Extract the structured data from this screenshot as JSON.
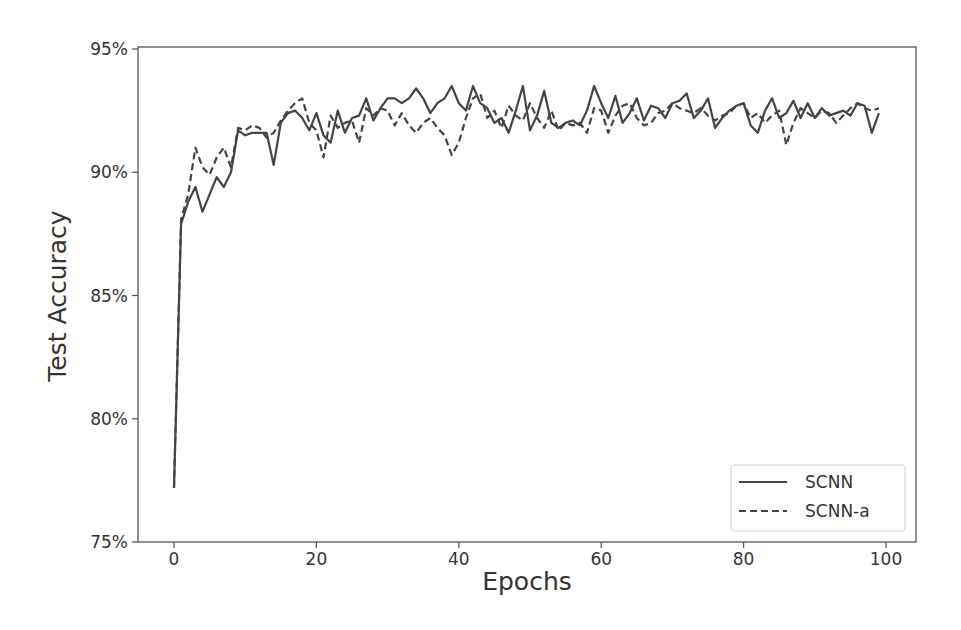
{
  "chart_data": {
    "type": "line",
    "title": "",
    "xlabel": "Epochs",
    "ylabel": "Test Accuracy",
    "xlim": [
      -5,
      104
    ],
    "ylim": [
      75,
      95
    ],
    "xticks": [
      0,
      20,
      40,
      60,
      80,
      100
    ],
    "yticks": [
      75,
      80,
      85,
      90,
      95
    ],
    "ytick_labels": [
      "75%",
      "80%",
      "85%",
      "90%",
      "95%"
    ],
    "grid": false,
    "legend_position": "lower right",
    "line_color": "#444444",
    "series": [
      {
        "name": "SCNN",
        "style": "solid",
        "x": [
          0,
          1,
          2,
          3,
          4,
          5,
          6,
          7,
          8,
          9,
          10,
          11,
          12,
          13,
          14,
          15,
          16,
          17,
          18,
          19,
          20,
          21,
          22,
          23,
          24,
          25,
          26,
          27,
          28,
          29,
          30,
          31,
          32,
          33,
          34,
          35,
          36,
          37,
          38,
          39,
          40,
          41,
          42,
          43,
          44,
          45,
          46,
          47,
          48,
          49,
          50,
          51,
          52,
          53,
          54,
          55,
          56,
          57,
          58,
          59,
          60,
          61,
          62,
          63,
          64,
          65,
          66,
          67,
          68,
          69,
          70,
          71,
          72,
          73,
          74,
          75,
          76,
          77,
          78,
          79,
          80,
          81,
          82,
          83,
          84,
          85,
          86,
          87,
          88,
          89,
          90,
          91,
          92,
          93,
          94,
          95,
          96,
          97,
          98,
          99
        ],
        "values": [
          77.2,
          87.9,
          88.8,
          89.4,
          88.4,
          89.1,
          89.8,
          89.4,
          90.0,
          91.7,
          91.5,
          91.6,
          91.6,
          91.6,
          90.3,
          92.0,
          92.4,
          92.5,
          92.2,
          91.7,
          92.4,
          91.5,
          91.2,
          92.5,
          91.6,
          92.2,
          92.3,
          93.0,
          92.1,
          92.6,
          93.0,
          93.0,
          92.8,
          93.0,
          93.4,
          93.0,
          92.4,
          92.8,
          93.0,
          93.5,
          92.8,
          92.5,
          93.5,
          92.8,
          92.6,
          92.0,
          92.2,
          91.6,
          92.5,
          93.5,
          91.7,
          92.3,
          93.3,
          92.0,
          91.8,
          92.0,
          92.1,
          91.9,
          92.5,
          93.5,
          92.8,
          92.2,
          93.1,
          92.0,
          92.4,
          93.0,
          92.1,
          92.7,
          92.6,
          92.2,
          92.8,
          92.9,
          93.2,
          92.2,
          92.5,
          93.0,
          91.8,
          92.2,
          92.5,
          92.7,
          92.8,
          91.9,
          91.6,
          92.5,
          93.0,
          92.2,
          92.4,
          92.9,
          92.2,
          92.8,
          92.2,
          92.6,
          92.3,
          92.4,
          92.5,
          92.3,
          92.8,
          92.7,
          91.6,
          92.4
        ]
      },
      {
        "name": "SCNN-a",
        "style": "dashed",
        "x": [
          0,
          1,
          2,
          3,
          4,
          5,
          6,
          7,
          8,
          9,
          10,
          11,
          12,
          13,
          14,
          15,
          16,
          17,
          18,
          19,
          20,
          21,
          22,
          23,
          24,
          25,
          26,
          27,
          28,
          29,
          30,
          31,
          32,
          33,
          34,
          35,
          36,
          37,
          38,
          39,
          40,
          41,
          42,
          43,
          44,
          45,
          46,
          47,
          48,
          49,
          50,
          51,
          52,
          53,
          54,
          55,
          56,
          57,
          58,
          59,
          60,
          61,
          62,
          63,
          64,
          65,
          66,
          67,
          68,
          69,
          70,
          71,
          72,
          73,
          74,
          75,
          76,
          77,
          78,
          79,
          80,
          81,
          82,
          83,
          84,
          85,
          86,
          87,
          88,
          89,
          90,
          91,
          92,
          93,
          94,
          95,
          96,
          97,
          98,
          99
        ],
        "values": [
          77.2,
          88.1,
          89.1,
          91.0,
          90.2,
          89.9,
          90.6,
          91.0,
          90.2,
          91.8,
          91.7,
          91.9,
          91.8,
          91.4,
          91.6,
          92.1,
          92.5,
          92.8,
          93.0,
          92.0,
          91.7,
          90.6,
          92.3,
          91.8,
          92.0,
          92.1,
          91.2,
          92.6,
          92.3,
          92.6,
          92.5,
          91.9,
          92.4,
          91.9,
          91.6,
          92.0,
          92.2,
          91.8,
          91.5,
          90.7,
          91.2,
          92.2,
          93.0,
          93.2,
          92.2,
          92.5,
          91.8,
          92.7,
          92.3,
          92.1,
          92.8,
          92.2,
          91.8,
          92.5,
          91.7,
          92.0,
          91.9,
          92.0,
          91.6,
          92.6,
          92.5,
          91.6,
          92.3,
          92.7,
          92.8,
          92.2,
          91.9,
          92.0,
          92.4,
          92.5,
          92.8,
          92.6,
          92.5,
          92.4,
          92.6,
          92.3,
          92.1,
          92.3,
          92.4,
          92.7,
          92.8,
          92.2,
          92.4,
          92.0,
          92.3,
          92.5,
          91.1,
          92.0,
          92.6,
          92.4,
          92.2,
          92.5,
          92.4,
          92.0,
          92.3,
          92.6,
          92.8,
          92.6,
          92.5,
          92.6
        ]
      }
    ]
  }
}
